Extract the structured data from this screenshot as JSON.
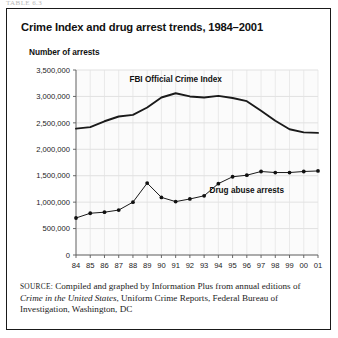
{
  "top_strip": {
    "clipped_text": "TABLE 6.3"
  },
  "figure": {
    "title": "Crime Index and drug arrest trends, 1984–2001",
    "axis_title": "Number of arrests",
    "source": {
      "label": "SOURCE:",
      "text_before_italic": " Compiled and graphed by Information Plus from annual editions of ",
      "italic_title": "Crime in the United States",
      "text_after_italic": ", Uniform Crime Reports, Federal Bureau of Investigation, Washington, DC"
    }
  },
  "chart_data": {
    "type": "line",
    "title": "Crime Index and drug arrest trends, 1984–2001",
    "xlabel": "",
    "ylabel": "Number of arrests",
    "ylim": [
      0,
      3500000
    ],
    "ytick_labels": [
      "0",
      "500,000",
      "1,000,000",
      "1,500,000",
      "2,000,000",
      "2,500,000",
      "3,000,000",
      "3,500,000"
    ],
    "ytick_values": [
      0,
      500000,
      1000000,
      1500000,
      2000000,
      2500000,
      3000000,
      3500000
    ],
    "categories": [
      "84",
      "85",
      "86",
      "87",
      "88",
      "89",
      "90",
      "91",
      "92",
      "93",
      "94",
      "95",
      "96",
      "97",
      "98",
      "99",
      "00",
      "01"
    ],
    "grid": true,
    "legend_position": "inline-annotation",
    "series": [
      {
        "name": "FBI Official Crime Index",
        "markers": false,
        "values": [
          2390000,
          2420000,
          2530000,
          2620000,
          2650000,
          2790000,
          2980000,
          3060000,
          3000000,
          2980000,
          3010000,
          2970000,
          2910000,
          2730000,
          2540000,
          2380000,
          2320000,
          2310000
        ]
      },
      {
        "name": "Drug abuse arrests",
        "markers": true,
        "values": [
          700000,
          790000,
          810000,
          850000,
          1000000,
          1360000,
          1090000,
          1010000,
          1060000,
          1120000,
          1350000,
          1480000,
          1510000,
          1580000,
          1560000,
          1560000,
          1580000,
          1590000
        ]
      }
    ],
    "annotations": [
      {
        "text": "FBI Official Crime Index",
        "x_category": "91",
        "value": 3280000
      },
      {
        "text": "Drug abuse arrests",
        "x_category": "96",
        "value": 1180000
      }
    ]
  }
}
